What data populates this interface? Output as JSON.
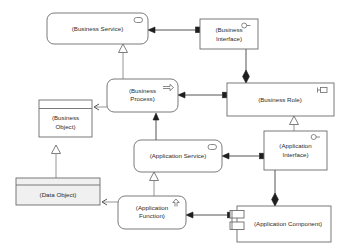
{
  "diagram": {
    "canvas": {
      "width": 340,
      "height": 252,
      "background": "#ffffff"
    },
    "colors": {
      "node_fill": "#ffffff",
      "node_fill_shaded": "#f0f0f0",
      "node_stroke": "#6b6b6b",
      "connector": "#555555",
      "text": "#2b2b2b"
    },
    "nodes": [
      {
        "id": "business-service",
        "label": "(Business Service)",
        "shape": "rounded-rectangle",
        "icon": "rounded-rect-icon",
        "x": 47,
        "y": 13,
        "w": 101,
        "h": 31
      },
      {
        "id": "business-interface",
        "label": "(Business Interface)",
        "label_lines": [
          "(Business",
          "Interface)"
        ],
        "shape": "rectangle",
        "icon": "lollipop-icon",
        "x": 200,
        "y": 19,
        "w": 58,
        "h": 30
      },
      {
        "id": "business-process",
        "label": "(Business Process)",
        "label_lines": [
          "(Business",
          "Process)"
        ],
        "shape": "rounded-rectangle",
        "icon": "arrow-right-icon",
        "x": 107,
        "y": 79,
        "w": 71,
        "h": 33
      },
      {
        "id": "business-role",
        "label": "(Business Role)",
        "shape": "rectangle",
        "icon": "role-cylinder-icon",
        "x": 227,
        "y": 83,
        "w": 107,
        "h": 33
      },
      {
        "id": "business-object",
        "label": "(Business Object)",
        "label_lines": [
          "(Business",
          "Object)"
        ],
        "shape": "object-rectangle",
        "icon": "none",
        "x": 39,
        "y": 100,
        "w": 53,
        "h": 37
      },
      {
        "id": "application-service",
        "label": "(Application Service)",
        "shape": "rounded-rectangle",
        "icon": "rounded-rect-icon",
        "x": 134,
        "y": 140,
        "w": 88,
        "h": 32
      },
      {
        "id": "application-interface",
        "label": "(Application Interface)",
        "label_lines": [
          "(Application",
          "Interface)"
        ],
        "shape": "rectangle",
        "icon": "lollipop-icon",
        "x": 264,
        "y": 131,
        "w": 63,
        "h": 39
      },
      {
        "id": "data-object",
        "label": "(Data Object)",
        "shape": "object-rectangle",
        "icon": "none",
        "x": 16,
        "y": 178,
        "w": 84,
        "h": 27,
        "shaded": true
      },
      {
        "id": "application-function",
        "label": "(Application Function)",
        "label_lines": [
          "(Application",
          "Function)"
        ],
        "shape": "rounded-rectangle",
        "icon": "arrow-up-icon",
        "x": 118,
        "y": 196,
        "w": 68,
        "h": 33
      },
      {
        "id": "application-component",
        "label": "(Application Component)",
        "shape": "component-rectangle",
        "icon": "component-tabs-icon",
        "x": 237,
        "y": 206,
        "w": 94,
        "h": 36
      }
    ],
    "connections": [
      {
        "id": "interface-to-service",
        "from": "business-interface",
        "to": "business-service",
        "type": "assignment",
        "source_marker": "filled-square",
        "target_marker": "solid-arrow"
      },
      {
        "id": "process-realizes-service",
        "from": "business-process",
        "to": "business-service",
        "type": "realization",
        "source_marker": "none",
        "target_marker": "hollow-triangle"
      },
      {
        "id": "role-composes-interface",
        "from": "business-interface",
        "to": "business-role",
        "type": "composition",
        "source_marker": "none",
        "target_marker": "filled-diamond"
      },
      {
        "id": "role-to-process",
        "from": "business-role",
        "to": "business-process",
        "type": "assignment",
        "source_marker": "filled-square",
        "target_marker": "solid-arrow"
      },
      {
        "id": "process-accesses-object",
        "from": "business-process",
        "to": "business-object",
        "type": "access",
        "source_marker": "none",
        "target_marker": "open-arrow"
      },
      {
        "id": "appservice-serves-process",
        "from": "application-service",
        "to": "business-process",
        "type": "serving",
        "source_marker": "none",
        "target_marker": "solid-arrow"
      },
      {
        "id": "appinterface-to-role",
        "from": "application-interface",
        "to": "business-role",
        "type": "realization",
        "source_marker": "none",
        "target_marker": "hollow-triangle"
      },
      {
        "id": "appinterface-to-appservice",
        "from": "application-interface",
        "to": "application-service",
        "type": "assignment",
        "source_marker": "filled-square",
        "target_marker": "solid-arrow"
      },
      {
        "id": "component-composes-interface",
        "from": "application-interface",
        "to": "application-component",
        "type": "composition",
        "source_marker": "none",
        "target_marker": "filled-diamond"
      },
      {
        "id": "appfunction-realizes-service",
        "from": "application-function",
        "to": "application-service",
        "type": "realization",
        "source_marker": "none",
        "target_marker": "hollow-triangle"
      },
      {
        "id": "component-to-function",
        "from": "application-component",
        "to": "application-function",
        "type": "assignment",
        "source_marker": "filled-square",
        "target_marker": "solid-arrow"
      },
      {
        "id": "function-accesses-dataobject",
        "from": "application-function",
        "to": "data-object",
        "type": "access",
        "source_marker": "none",
        "target_marker": "open-arrow"
      },
      {
        "id": "dataobject-realizes-object",
        "from": "data-object",
        "to": "business-object",
        "type": "realization",
        "source_marker": "none",
        "target_marker": "hollow-triangle"
      }
    ]
  }
}
